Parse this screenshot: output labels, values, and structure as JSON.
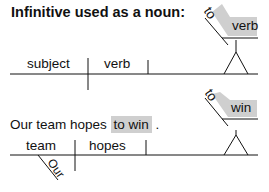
{
  "title": "Infinitive used as a noun:",
  "diagram1": {
    "subject": "subject",
    "verb": "verb",
    "infinitive_to": "to",
    "infinitive_verb": "verb"
  },
  "example": {
    "sentence_pre": "Our team hopes ",
    "sentence_highlight": "to win",
    "sentence_post": " .",
    "subject": "team",
    "modifier": "Our",
    "verb": "hopes",
    "infinitive_to": "to",
    "infinitive_verb": "win"
  },
  "colors": {
    "highlight": "#cfcfcf",
    "line": "#111111"
  }
}
